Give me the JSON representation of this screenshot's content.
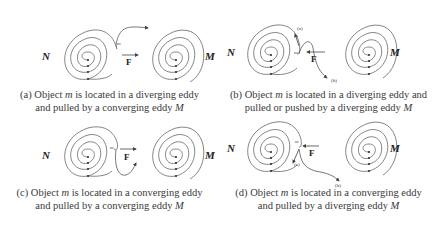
{
  "panels": [
    {
      "id": "a",
      "left_eddy": "N",
      "right_eddy": "M",
      "object": "m",
      "force": "F",
      "force_direction": "right",
      "left_type": "diverging",
      "right_type": "converging",
      "caption_line1_pre": "(a) Object ",
      "caption_line1_obj": "m",
      "caption_line1_post": " is located in a diverging eddy",
      "caption_line2_pre": "and pulled by a converging eddy ",
      "caption_line2_eddy": "M"
    },
    {
      "id": "b",
      "left_eddy": "N",
      "right_eddy": "M",
      "object": "m",
      "force": "F",
      "force_direction": "left",
      "left_type": "diverging",
      "right_type": "diverging",
      "path_labels": [
        "(a)",
        "(b)"
      ],
      "caption_line1_pre": "(b) Object ",
      "caption_line1_obj": "m",
      "caption_line1_post": " is located in a diverging eddy and",
      "caption_line2_pre": "pulled or pushed by a diverging eddy ",
      "caption_line2_eddy": "M"
    },
    {
      "id": "c",
      "left_eddy": "N",
      "right_eddy": "M",
      "object": "m",
      "force": "F",
      "force_direction": "right",
      "left_type": "converging",
      "right_type": "converging",
      "caption_line1_pre": "(c)  Object ",
      "caption_line1_obj": "m",
      "caption_line1_post": " is located in a converging eddy",
      "caption_line2_pre": "and pulled by a converging eddy ",
      "caption_line2_eddy": "M"
    },
    {
      "id": "d",
      "left_eddy": "N",
      "right_eddy": "M",
      "object": "m",
      "force": "F",
      "force_direction": "left",
      "left_type": "converging",
      "right_type": "diverging",
      "path_labels": [
        "(a)",
        "(b)"
      ],
      "caption_line1_pre": "(d) Object ",
      "caption_line1_obj": "m",
      "caption_line1_post": " is located in a converging eddy",
      "caption_line2_pre": "and pulled by a diverging eddy ",
      "caption_line2_eddy": "M"
    }
  ],
  "colors": {
    "stroke": "#555555",
    "text": "#333333",
    "background": "#ffffff"
  }
}
